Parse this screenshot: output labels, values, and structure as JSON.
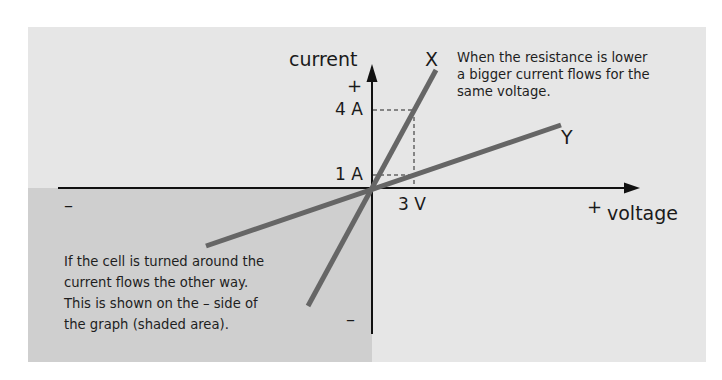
{
  "diagram": {
    "axes": {
      "y_label": "current",
      "x_label": "voltage",
      "y_positive": "+",
      "y_negative": "–",
      "x_positive": "+",
      "x_negative": "–"
    },
    "ticks": {
      "y_high": "4 A",
      "y_low": "1 A",
      "x_mark": "3 V"
    },
    "lines": [
      {
        "name": "X",
        "label": "X",
        "meaning": "lower resistance (steeper)"
      },
      {
        "name": "Y",
        "label": "Y",
        "meaning": "higher resistance (shallower)"
      }
    ],
    "annotations": {
      "top_right": [
        "When the resistance is lower",
        "a bigger current flows for the",
        "same voltage."
      ],
      "bottom_left": [
        "If the cell is turned around the",
        "current flows the other way.",
        "This is shown on the – side of",
        "the graph (shaded area)."
      ]
    },
    "colors": {
      "panel": "#e6e6e6",
      "shaded_area": "#cfcfcf",
      "line": "#666666",
      "axis": "#111111"
    }
  }
}
